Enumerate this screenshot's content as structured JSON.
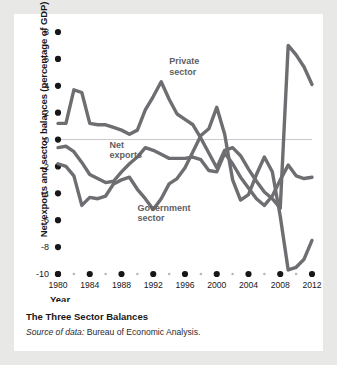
{
  "chart_data": {
    "type": "line",
    "title": "The Three Sector Balances",
    "subtitle": "Source of data: Bureau of Economic Analysis.",
    "xlabel": "Year",
    "ylabel": "Net exports and sector balances (percentage of GDP)",
    "xlim": [
      1980,
      2012
    ],
    "ylim": [
      -10,
      8
    ],
    "yticks": [
      "8",
      "6",
      "4",
      "2",
      "0",
      "-2",
      "-4",
      "-6",
      "-8",
      "-10"
    ],
    "ytick_values": [
      8,
      6,
      4,
      2,
      0,
      -2,
      -4,
      -6,
      -8,
      -10
    ],
    "xticks": [
      "1980",
      "1984",
      "1988",
      "1992",
      "1996",
      "2000",
      "2004",
      "2008",
      "2012"
    ],
    "xtick_values": [
      1980,
      1984,
      1988,
      1992,
      1996,
      2000,
      2004,
      2008,
      2012
    ],
    "grid": false,
    "zero_line": true,
    "legend_position": "inline-annotations",
    "line_color": "#6e6e72",
    "annotations": [
      {
        "label": "Private sector",
        "x": 1994,
        "y": 5.6
      },
      {
        "label": "Net exports",
        "x": 1986.5,
        "y": -0.6
      },
      {
        "label": "Government sector",
        "x": 1990,
        "y": -5.3
      }
    ],
    "x": [
      1980,
      1981,
      1982,
      1983,
      1984,
      1985,
      1986,
      1987,
      1988,
      1989,
      1990,
      1991,
      1992,
      1993,
      1994,
      1995,
      1996,
      1997,
      1998,
      1999,
      2000,
      2001,
      2002,
      2003,
      2004,
      2005,
      2006,
      2007,
      2008,
      2009,
      2010,
      2011,
      2012
    ],
    "series": [
      {
        "name": "Private sector",
        "values": [
          1.2,
          1.2,
          3.7,
          3.5,
          1.2,
          1.1,
          1.1,
          0.9,
          0.7,
          0.4,
          0.7,
          2.2,
          3.2,
          4.3,
          3.0,
          1.9,
          1.5,
          1.1,
          0.1,
          -1.0,
          -2.1,
          -0.8,
          -0.6,
          -1.2,
          -2.2,
          -3.1,
          -3.9,
          -4.4,
          -5.1,
          7.0,
          6.3,
          5.4,
          4.1
        ]
      },
      {
        "name": "Net exports",
        "values": [
          -0.6,
          -0.5,
          -0.9,
          -1.7,
          -2.6,
          -2.9,
          -3.2,
          -3.1,
          -2.4,
          -1.8,
          -1.3,
          -0.6,
          -0.8,
          -1.1,
          -1.4,
          -1.4,
          -1.4,
          -1.3,
          -1.5,
          -2.3,
          -2.4,
          -1.0,
          -1.8,
          -2.8,
          -3.6,
          -4.4,
          -4.9,
          -4.2,
          -3.0,
          -1.9,
          -2.7,
          -2.9,
          -2.8
        ]
      },
      {
        "name": "Government sector",
        "values": [
          -1.8,
          -2.0,
          -2.7,
          -4.9,
          -4.3,
          -4.4,
          -4.2,
          -3.3,
          -3.0,
          -2.8,
          -3.7,
          -4.4,
          -5.2,
          -4.4,
          -3.3,
          -2.9,
          -2.1,
          -0.9,
          0.3,
          0.8,
          2.4,
          0.4,
          -3.0,
          -4.5,
          -4.1,
          -2.6,
          -1.3,
          -2.4,
          -5.7,
          -9.7,
          -9.5,
          -8.9,
          -7.5
        ]
      }
    ]
  }
}
